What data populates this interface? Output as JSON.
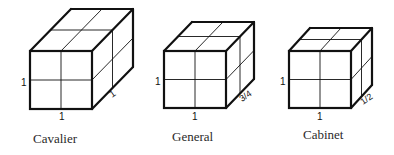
{
  "figure": {
    "cubes": [
      {
        "id": "cavalier",
        "caption": "Cavalier",
        "height_label": "1",
        "width_label": "1",
        "depth_label": "1",
        "front": [
          30,
          51,
          92,
          109
        ],
        "depth_offset": [
          41,
          -42
        ],
        "caption_pos": [
          33,
          143
        ],
        "h_label_pos": [
          21,
          86
        ],
        "w_label_pos": [
          59,
          120
        ],
        "d_label_pos": [
          112,
          98
        ]
      },
      {
        "id": "general",
        "caption": "General",
        "height_label": "1",
        "width_label": "1",
        "depth_label": "3/4",
        "front": [
          164,
          51,
          226,
          108
        ],
        "depth_offset": [
          28,
          -29
        ],
        "caption_pos": [
          172,
          141
        ],
        "h_label_pos": [
          155,
          85
        ],
        "w_label_pos": [
          192,
          120
        ],
        "d_label_pos": [
          242,
          102
        ]
      },
      {
        "id": "cabinet",
        "caption": "Cabinet",
        "height_label": "1",
        "width_label": "1",
        "depth_label": "1/2",
        "front": [
          289,
          51,
          351,
          108
        ],
        "depth_offset": [
          21,
          -23
        ],
        "caption_pos": [
          303,
          139
        ],
        "h_label_pos": [
          280,
          85
        ],
        "w_label_pos": [
          317,
          120
        ],
        "d_label_pos": [
          363,
          105
        ]
      }
    ]
  }
}
